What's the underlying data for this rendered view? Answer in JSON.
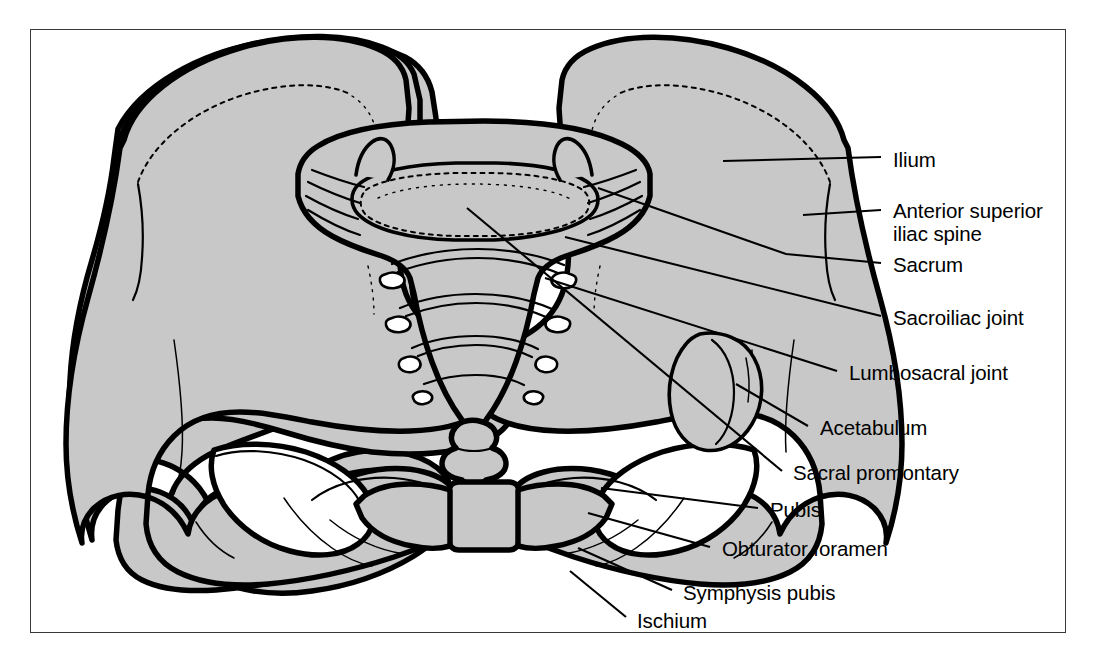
{
  "figure": {
    "kind": "anatomical-illustration",
    "frame_border_color": "#3a3a3a",
    "bone_fill_color": "#c8c8c8",
    "bone_outline_color": "#000000",
    "background_color": "#ffffff"
  },
  "labels": [
    {
      "id": "ilium",
      "text": "Ilium",
      "x": 893,
      "y": 149,
      "lines": 1
    },
    {
      "id": "anterior-superior-iliac-spine",
      "text": "Anterior superior",
      "text2": "iliac spine",
      "x": 893,
      "y": 200,
      "lines": 2
    },
    {
      "id": "sacrum",
      "text": "Sacrum",
      "x": 893,
      "y": 253,
      "lines": 1
    },
    {
      "id": "sacroiliac-joint",
      "text": "Sacroiliac joint",
      "x": 893,
      "y": 306,
      "lines": 1
    },
    {
      "id": "lumbosacral-joint",
      "text": "Lumbosacral joint",
      "x": 849,
      "y": 361,
      "lines": 1
    },
    {
      "id": "acetabulum",
      "text": "Acetabulum",
      "x": 820,
      "y": 416,
      "lines": 1
    },
    {
      "id": "sacral-promontary",
      "text": "Sacral promontary",
      "x": 793,
      "y": 461,
      "lines": 1
    },
    {
      "id": "pubis",
      "text": "Pubis",
      "x": 770,
      "y": 498,
      "lines": 1
    },
    {
      "id": "obturator-foramen",
      "text": "Obturator foramen",
      "x": 722,
      "y": 537,
      "lines": 1
    },
    {
      "id": "symphysis-pubis",
      "text": "Symphysis pubis",
      "x": 683,
      "y": 581,
      "lines": 1
    },
    {
      "id": "ischium",
      "text": "Ischium",
      "x": 637,
      "y": 609,
      "lines": 1
    }
  ],
  "leader_lines": [
    {
      "id": "leader-ilium",
      "points": "723,161 881,157"
    },
    {
      "id": "leader-anterior-superior-iliac-spine",
      "points": "803,215 881,210"
    },
    {
      "id": "leader-sacrum",
      "points": "598,188 786,254 881,263"
    },
    {
      "id": "leader-sacroiliac-joint",
      "points": "565,237 881,316"
    },
    {
      "id": "leader-lumbosacral-joint",
      "points": "545,278 837,371"
    },
    {
      "id": "leader-acetabulum",
      "points": "736,384 808,426"
    },
    {
      "id": "leader-sacral-promontary",
      "points": "467,208 782,471"
    },
    {
      "id": "leader-pubis",
      "points": "601,488 758,508"
    },
    {
      "id": "leader-obturator-foramen",
      "points": "588,513 710,547"
    },
    {
      "id": "leader-symphysis-pubis",
      "points": "578,548 672,590"
    },
    {
      "id": "leader-ischium",
      "points": "570,571 626,617"
    }
  ]
}
